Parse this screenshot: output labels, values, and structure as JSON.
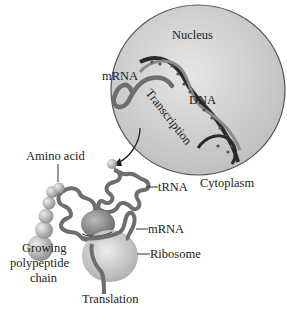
{
  "diagram": {
    "regions": {
      "nucleus": "Nucleus",
      "cytoplasm": "Cytoplasm"
    },
    "labels": {
      "mrna_nucleus": "mRNA",
      "dna": "DNA",
      "transcription": "Transcription",
      "amino_acid": "Amino acid",
      "trna": "tRNA",
      "mrna_ribosome": "mRNA",
      "ribosome": "Ribosome",
      "growing_chain_line1": "Growing",
      "growing_chain_line2": "polypeptide",
      "growing_chain_line3": "chain",
      "translation": "Translation"
    },
    "colors": {
      "nucleus_fill": "#c9c9c9",
      "nucleus_border": "#555555",
      "strand": "#6e6e6e",
      "dna_dark": "#2a2a2a",
      "sphere": "#b5b5b5",
      "ribosome_large": "#c4c4c4",
      "ribosome_small": "#8f8f8f"
    }
  }
}
